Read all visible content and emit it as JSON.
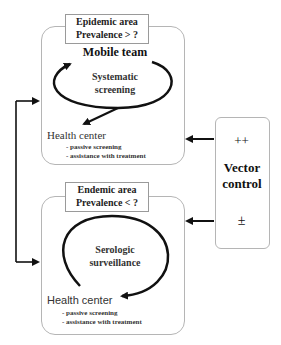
{
  "epidemic": {
    "header_line1": "Epidemic area",
    "header_line2": "Prevalence > ?",
    "team": "Mobile team",
    "cycle_line1": "Systematic",
    "cycle_line2": "screening",
    "health_center": "Health center",
    "items": [
      "- passive screening",
      "- assistance with treatment"
    ]
  },
  "endemic": {
    "header_line1": "Endemic area",
    "header_line2": "Prevalence < ?",
    "cycle_line1": "Serologic",
    "cycle_line2": "surveillance",
    "health_center": "Health center",
    "items": [
      "- passive screening",
      "- assistance with treatment"
    ]
  },
  "vector_control": {
    "top_symbol": "++",
    "label_line1": "Vector",
    "label_line2": "control",
    "bottom_symbol": "±"
  },
  "colors": {
    "line": "#111111",
    "border": "#b5b5b5"
  }
}
